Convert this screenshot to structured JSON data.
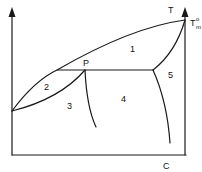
{
  "diagram": {
    "type": "phase-diagram",
    "axes": {
      "y_label": "T",
      "x_label": "C",
      "melting_point_label": "T",
      "melting_point_sub": "m",
      "melting_point_sup": "o"
    },
    "point_label": "P",
    "regions": [
      {
        "id": "1",
        "label": "1"
      },
      {
        "id": "2",
        "label": "2"
      },
      {
        "id": "3",
        "label": "3"
      },
      {
        "id": "4",
        "label": "4"
      },
      {
        "id": "5",
        "label": "5"
      }
    ],
    "colors": {
      "line": "#1a1a1a",
      "background": "#ffffff"
    }
  }
}
